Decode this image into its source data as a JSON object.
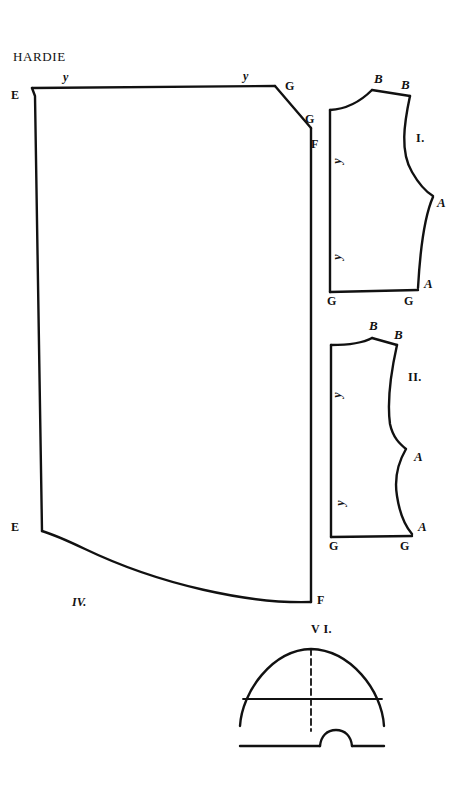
{
  "document": {
    "title": "HARDIE",
    "background_color": "#ffffff",
    "ink_color": "#111111"
  },
  "pieces": [
    {
      "id": "IV",
      "label": "IV.",
      "label_x": 72,
      "label_y": 596,
      "description": "large quadrilateral skirt panel"
    },
    {
      "id": "I",
      "label": "I.",
      "label_x": 416,
      "label_y": 132,
      "description": "front bodice panel"
    },
    {
      "id": "II",
      "label": "II.",
      "label_x": 408,
      "label_y": 371,
      "description": "back bodice panel"
    },
    {
      "id": "VI",
      "label": "V I.",
      "label_x": 311,
      "label_y": 623,
      "description": "semicircular hood or cap piece"
    }
  ],
  "vertex_labels": [
    {
      "text": "E",
      "x": 11,
      "y": 89,
      "style": "vertex",
      "piece": "IV"
    },
    {
      "text": "y",
      "x": 63,
      "y": 71,
      "style": "ymark",
      "piece": "IV"
    },
    {
      "text": "y",
      "x": 243,
      "y": 70,
      "style": "ymark",
      "piece": "IV"
    },
    {
      "text": "G",
      "x": 285,
      "y": 80,
      "style": "vertex",
      "piece": "IV"
    },
    {
      "text": "G",
      "x": 305,
      "y": 113,
      "style": "vertex",
      "piece": "IV"
    },
    {
      "text": "F",
      "x": 311,
      "y": 138,
      "style": "vertex",
      "piece": "IV"
    },
    {
      "text": "E",
      "x": 11,
      "y": 521,
      "style": "vertex",
      "piece": "IV"
    },
    {
      "text": "F",
      "x": 317,
      "y": 594,
      "style": "vertex",
      "piece": "IV"
    },
    {
      "text": "B",
      "x": 374,
      "y": 72,
      "style": "vertex-italic",
      "piece": "I"
    },
    {
      "text": "B",
      "x": 401,
      "y": 78,
      "style": "vertex-italic",
      "piece": "I"
    },
    {
      "text": "y",
      "x": 334,
      "y": 155,
      "style": "ymark-rot",
      "piece": "I"
    },
    {
      "text": "y",
      "x": 334,
      "y": 251,
      "style": "ymark-rot",
      "piece": "I"
    },
    {
      "text": "A",
      "x": 437,
      "y": 196,
      "style": "vertex-italic",
      "piece": "I"
    },
    {
      "text": "A",
      "x": 424,
      "y": 277,
      "style": "vertex-italic",
      "piece": "I"
    },
    {
      "text": "G",
      "x": 327,
      "y": 295,
      "style": "vertex",
      "piece": "I"
    },
    {
      "text": "G",
      "x": 404,
      "y": 295,
      "style": "vertex",
      "piece": "I"
    },
    {
      "text": "B",
      "x": 369,
      "y": 319,
      "style": "vertex-italic",
      "piece": "II"
    },
    {
      "text": "B",
      "x": 394,
      "y": 328,
      "style": "vertex-italic",
      "piece": "II"
    },
    {
      "text": "y",
      "x": 334,
      "y": 389,
      "style": "ymark-rot",
      "piece": "II"
    },
    {
      "text": "y",
      "x": 337,
      "y": 497,
      "style": "ymark-rot",
      "piece": "II"
    },
    {
      "text": "A",
      "x": 414,
      "y": 450,
      "style": "vertex-italic",
      "piece": "II"
    },
    {
      "text": "A",
      "x": 418,
      "y": 520,
      "style": "vertex-italic",
      "piece": "II"
    },
    {
      "text": "G",
      "x": 329,
      "y": 540,
      "style": "vertex",
      "piece": "II"
    },
    {
      "text": "G",
      "x": 400,
      "y": 540,
      "style": "vertex",
      "piece": "II"
    }
  ],
  "geometry": {
    "piece_IV_outline": "M 32 88 L 275 86 L 311 128 L 311 602 L 258 601 C 190 601 120 572 42 531 L 35 531 Z",
    "piece_IV_top_edge": "M 32 88 L 275 86",
    "piece_IV_right_upper": "M 275 86 L 311 128",
    "piece_IV_right_edge": "M 311 128 L 311 602",
    "piece_IV_bottom_curve": "M 311 602 C 250 604 160 585 85 549 C 66 540 52 534 42 531",
    "piece_IV_left_edge": "M 42 531 L 35 96 L 32 88",
    "piece_I_outline": "M 330 292 L 330 110 C 346 108 360 101 372 90 L 410 96 C 406 120 402 150 412 170 C 420 186 428 192 433 196 L 429 198 C 424 212 420 250 418 288 L 330 292 Z",
    "piece_I_left_edge": "M 330 110 L 330 292",
    "piece_I_neck_curve": "M 330 110 C 347 109 361 101 372 90",
    "piece_I_shoulder": "M 372 90 L 410 96",
    "piece_I_armhole": "M 410 96 C 404 124 400 152 412 172 C 420 186 428 193 433 196",
    "piece_I_side_seam": "M 433 197 C 425 215 420 252 418 288",
    "piece_I_hem": "M 330 292 L 418 290",
    "piece_II_outline": "M 331 537 L 331 345 C 345 344 360 344 372 338 L 397 345 C 392 370 388 400 390 425 C 392 438 400 444 406 448 C 400 460 394 478 396 496 C 399 515 405 526 412 534 L 331 537 Z",
    "piece_II_left_edge": "M 331 345 L 331 537",
    "piece_II_neck_curve": "M 331 345 C 346 345 361 344 372 338",
    "piece_II_shoulder": "M 372 338 L 397 345",
    "piece_II_side_curve": "M 397 345 C 391 372 387 402 390 424 C 393 438 400 444 406 449 C 399 461 394 478 397 496 C 400 516 406 527 412 534",
    "piece_II_hem": "M 331 537 L 412 536",
    "piece_VI_dome": "M 240 746 L 240 726 C 242 692 272 655 311 649 C 350 655 382 690 384 726 L 384 746 L 352 746 C 350 736 344 731 336 731 C 328 731 322 736 320 746 Z",
    "piece_VI_arc": "M 240 726 C 242 692 272 650 311 649 C 350 650 382 690 384 726",
    "piece_VI_base_left": "M 240 746 L 320 746",
    "piece_VI_base_right": "M 352 746 L 384 746",
    "piece_VI_notch": "M 320 746 C 321 736 327 730 336 730 C 345 730 351 736 352 746",
    "piece_VI_horizontal": "M 243 699 L 382 699",
    "piece_VI_center_dashed": "M 311 649 L 311 731"
  },
  "style_values": {
    "stroke_width_outline": 2.4,
    "stroke_width_inner": 1.8,
    "dash_pattern": "6,4"
  }
}
